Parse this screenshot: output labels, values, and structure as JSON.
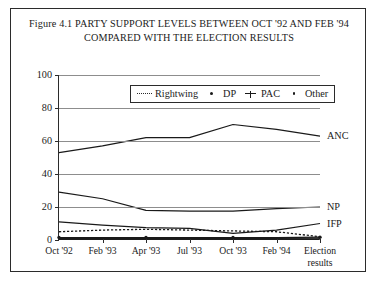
{
  "figure": {
    "title_line1": "Figure 4.1  PARTY SUPPORT LEVELS BETWEEN OCT '92 AND FEB '94",
    "title_line2": "COMPARED WITH THE ELECTION RESULTS"
  },
  "legend": {
    "entries": [
      {
        "label": "Rightwing",
        "marker": "dotted-line-marker"
      },
      {
        "label": "DP",
        "marker": "dot-marker"
      },
      {
        "label": "PAC",
        "marker": "plus-marker"
      },
      {
        "label": "Other",
        "marker": "small-dot-marker"
      }
    ]
  },
  "axis": {
    "y_ticks": [
      "0",
      "20",
      "40",
      "60",
      "80",
      "100"
    ],
    "x_ticks": [
      "Oct '92",
      "Feb '93",
      "Apr '93",
      "Jul '93",
      "Oct '93",
      "Feb '94",
      "Election results"
    ]
  },
  "series_labels": [
    {
      "name": "ANC",
      "value": 63
    },
    {
      "name": "NP",
      "value": 20
    },
    {
      "name": "IFP",
      "value": 10
    }
  ],
  "chart_data": {
    "type": "line",
    "title": "Figure 4.1  PARTY SUPPORT LEVELS BETWEEN OCT '92 AND FEB '94 COMPARED WITH THE ELECTION RESULTS",
    "xlabel": "",
    "ylabel": "",
    "ylim": [
      0,
      100
    ],
    "yticks": [
      0,
      20,
      40,
      60,
      80,
      100
    ],
    "grid": true,
    "legend_position": "top-center-inside",
    "categories": [
      "Oct '92",
      "Feb '93",
      "Apr '93",
      "Jul '93",
      "Oct '93",
      "Feb '94",
      "Election results"
    ],
    "series": [
      {
        "name": "ANC",
        "style": "solid",
        "labelled_at_right": true,
        "values": [
          53,
          57,
          62,
          62,
          70,
          67,
          63
        ]
      },
      {
        "name": "NP",
        "style": "solid",
        "labelled_at_right": true,
        "values": [
          29,
          25,
          18,
          17.5,
          17.5,
          19,
          20
        ]
      },
      {
        "name": "IFP",
        "style": "solid",
        "labelled_at_right": true,
        "values": [
          11,
          9,
          7.5,
          7,
          4,
          6,
          10
        ]
      },
      {
        "name": "Rightwing",
        "style": "dotted",
        "labelled_at_right": false,
        "values": [
          5,
          6,
          6.5,
          6,
          5.5,
          5,
          2
        ]
      },
      {
        "name": "DP",
        "style": "solid-with-dots",
        "labelled_at_right": false,
        "values": [
          1.5,
          1.5,
          1.5,
          1.5,
          1.5,
          1.5,
          1.7
        ]
      },
      {
        "name": "PAC",
        "style": "solid",
        "labelled_at_right": false,
        "values": [
          1,
          1,
          1,
          1,
          1,
          1,
          1.2
        ]
      },
      {
        "name": "Other",
        "style": "solid",
        "labelled_at_right": false,
        "values": [
          0.6,
          0.6,
          0.6,
          0.6,
          0.6,
          0.6,
          0.6
        ]
      }
    ]
  }
}
